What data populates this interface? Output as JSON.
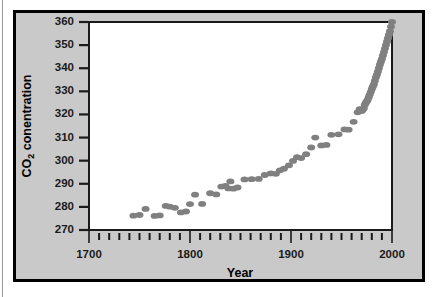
{
  "figure": {
    "background_color": "#c9c9c9",
    "frame_color": "#000000",
    "plot_background_color": "#ffffff"
  },
  "chart_data": {
    "type": "scatter",
    "title": "",
    "xlabel": "Year",
    "ylabel": "CO2 conentration",
    "ylabel_main": "CO",
    "ylabel_subscript": "2",
    "ylabel_rest": " conentration",
    "xlim": [
      1700,
      2000
    ],
    "ylim": [
      270,
      360
    ],
    "grid": false,
    "legend": null,
    "marker_color": "#808080",
    "marker_shape": "ellipse",
    "x_major_ticks": [
      1700,
      1800,
      1900,
      2000
    ],
    "x_major_tick_labels": [
      "1700",
      "1800",
      "1900",
      "2000"
    ],
    "x_minor_tick_step": 10,
    "y_ticks": [
      270,
      280,
      290,
      300,
      310,
      320,
      330,
      340,
      350,
      360
    ],
    "y_tick_labels": [
      "270",
      "280",
      "290",
      "300",
      "310",
      "320",
      "330",
      "340",
      "350",
      "360"
    ],
    "points": [
      {
        "x": 1744,
        "y": 276.2
      },
      {
        "x": 1750,
        "y": 276.5
      },
      {
        "x": 1756,
        "y": 279.1
      },
      {
        "x": 1765,
        "y": 276.1
      },
      {
        "x": 1770,
        "y": 276.3
      },
      {
        "x": 1776,
        "y": 280.4
      },
      {
        "x": 1780,
        "y": 280.1
      },
      {
        "x": 1785,
        "y": 279.6
      },
      {
        "x": 1791,
        "y": 277.6
      },
      {
        "x": 1796,
        "y": 278.0
      },
      {
        "x": 1800,
        "y": 281.2
      },
      {
        "x": 1805,
        "y": 285.3
      },
      {
        "x": 1812,
        "y": 281.3
      },
      {
        "x": 1820,
        "y": 285.9
      },
      {
        "x": 1826,
        "y": 285.4
      },
      {
        "x": 1831,
        "y": 288.8
      },
      {
        "x": 1835,
        "y": 289.1
      },
      {
        "x": 1838,
        "y": 288.0
      },
      {
        "x": 1840,
        "y": 291.0
      },
      {
        "x": 1843,
        "y": 287.9
      },
      {
        "x": 1847,
        "y": 288.4
      },
      {
        "x": 1854,
        "y": 291.9
      },
      {
        "x": 1861,
        "y": 292.0
      },
      {
        "x": 1868,
        "y": 292.1
      },
      {
        "x": 1874,
        "y": 293.8
      },
      {
        "x": 1880,
        "y": 294.5
      },
      {
        "x": 1885,
        "y": 294.3
      },
      {
        "x": 1889,
        "y": 295.8
      },
      {
        "x": 1893,
        "y": 296.5
      },
      {
        "x": 1898,
        "y": 298.0
      },
      {
        "x": 1902,
        "y": 299.9
      },
      {
        "x": 1906,
        "y": 301.5
      },
      {
        "x": 1910,
        "y": 301.1
      },
      {
        "x": 1915,
        "y": 302.8
      },
      {
        "x": 1920,
        "y": 305.7
      },
      {
        "x": 1924,
        "y": 310.0
      },
      {
        "x": 1930,
        "y": 306.6
      },
      {
        "x": 1935,
        "y": 306.8
      },
      {
        "x": 1940,
        "y": 311.2
      },
      {
        "x": 1947,
        "y": 311.4
      },
      {
        "x": 1953,
        "y": 313.5
      },
      {
        "x": 1957,
        "y": 313.4
      },
      {
        "x": 1962,
        "y": 316.8
      },
      {
        "x": 1966,
        "y": 320.9
      },
      {
        "x": 1968,
        "y": 322.3
      },
      {
        "x": 1970,
        "y": 321.5
      },
      {
        "x": 1971,
        "y": 322.0
      },
      {
        "x": 1972,
        "y": 322.6
      },
      {
        "x": 1973,
        "y": 324.1
      },
      {
        "x": 1974,
        "y": 325.0
      },
      {
        "x": 1975,
        "y": 325.6
      },
      {
        "x": 1976,
        "y": 326.4
      },
      {
        "x": 1977,
        "y": 327.5
      },
      {
        "x": 1978,
        "y": 328.6
      },
      {
        "x": 1979,
        "y": 329.8
      },
      {
        "x": 1980,
        "y": 331.0
      },
      {
        "x": 1981,
        "y": 332.0
      },
      {
        "x": 1982,
        "y": 333.0
      },
      {
        "x": 1983,
        "y": 334.5
      },
      {
        "x": 1984,
        "y": 336.0
      },
      {
        "x": 1985,
        "y": 337.2
      },
      {
        "x": 1986,
        "y": 338.5
      },
      {
        "x": 1987,
        "y": 340.0
      },
      {
        "x": 1988,
        "y": 341.5
      },
      {
        "x": 1989,
        "y": 342.8
      },
      {
        "x": 1990,
        "y": 344.0
      },
      {
        "x": 1991,
        "y": 345.5
      },
      {
        "x": 1992,
        "y": 347.0
      },
      {
        "x": 1993,
        "y": 348.5
      },
      {
        "x": 1994,
        "y": 350.0
      },
      {
        "x": 1995,
        "y": 351.5
      },
      {
        "x": 1996,
        "y": 353.0
      },
      {
        "x": 1997,
        "y": 354.5
      },
      {
        "x": 1998,
        "y": 356.0
      },
      {
        "x": 1999,
        "y": 358.0
      },
      {
        "x": 2000,
        "y": 360.0
      }
    ]
  }
}
